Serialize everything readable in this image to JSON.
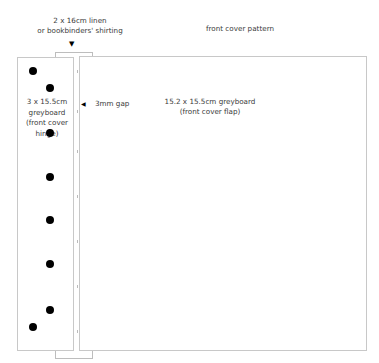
{
  "title": "front cover pattern",
  "labels": {
    "linen_line1": "2 x 16cm linen",
    "linen_line2": "or bookbinders' shirting",
    "hinge_line1": "3 x 15.5cm",
    "hinge_line2": "greyboard",
    "hinge_line3": "(front cover",
    "hinge_line4": "hinge)",
    "gap": "3mm gap",
    "flap_line1": "15.2 x 15.5cm greyboard",
    "flap_line2": "(front cover flap)"
  },
  "icons": {
    "linen_arrow": "▼",
    "gap_arrow": "◀"
  },
  "colors": {
    "outline": "#c8c8c8",
    "dot": "#000000",
    "text": "#3a3a3a"
  },
  "holes": [
    {
      "x": 33,
      "y": 71
    },
    {
      "x": 50,
      "y": 88
    },
    {
      "x": 50,
      "y": 133
    },
    {
      "x": 50,
      "y": 177
    },
    {
      "x": 50,
      "y": 220
    },
    {
      "x": 50,
      "y": 264
    },
    {
      "x": 50,
      "y": 310
    },
    {
      "x": 33,
      "y": 327
    }
  ]
}
